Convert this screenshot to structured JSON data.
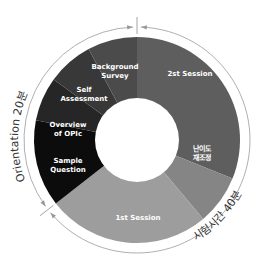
{
  "diagram": {
    "center": [
      137,
      140
    ],
    "outer_radius": 103,
    "inner_radius": 42,
    "arc_radius": 113,
    "segments": [
      {
        "id": "2st-session",
        "label_lines": [
          "2st Session"
        ],
        "start_deg": 0,
        "end_deg": 112,
        "color": "#5e5e5e",
        "label_pos": [
          190,
          76
        ]
      },
      {
        "id": "difficulty-readjust",
        "label_lines": [
          "난이도",
          "재조정"
        ],
        "start_deg": 112,
        "end_deg": 140,
        "color": "#858585",
        "label_pos": [
          202,
          155
        ]
      },
      {
        "id": "1st-session",
        "label_lines": [
          "1st Session"
        ],
        "start_deg": 140,
        "end_deg": 232,
        "color": "#9d9d9d",
        "label_pos": [
          138,
          220
        ]
      },
      {
        "id": "sample-question",
        "label_lines": [
          "Sample",
          "Question"
        ],
        "start_deg": 232,
        "end_deg": 281,
        "color": "#0c0c0c",
        "label_pos": [
          68,
          167
        ]
      },
      {
        "id": "overview-of-opic",
        "label_lines": [
          "Overview",
          "of OPIc"
        ],
        "start_deg": 281,
        "end_deg": 306,
        "color": "#262626",
        "label_pos": [
          68,
          131
        ]
      },
      {
        "id": "self-assessment",
        "label_lines": [
          "Self",
          "Assessment"
        ],
        "start_deg": 306,
        "end_deg": 332,
        "color": "#383838",
        "label_pos": [
          84,
          96
        ]
      },
      {
        "id": "background-survey",
        "label_lines": [
          "Background",
          "Survey"
        ],
        "start_deg": 332,
        "end_deg": 360,
        "color": "#4b4b4b",
        "label_pos": [
          115,
          73
        ]
      }
    ],
    "phases": [
      {
        "id": "orientation",
        "label": "Orientation 20분",
        "start_deg": 232,
        "end_deg": 360
      },
      {
        "id": "test-time",
        "label": "시험시간 40분",
        "start_deg": 0,
        "end_deg": 232
      }
    ],
    "colors": {
      "arc_line": "#9a9a9a",
      "hole": "#ffffff",
      "text": "#ffffff",
      "ring_text": "#333333"
    }
  }
}
